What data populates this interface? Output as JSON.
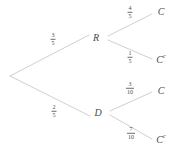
{
  "figure": {
    "type": "probability-tree-diagram",
    "width": 176,
    "height": 152,
    "background_color": "#ffffff",
    "line_color": "#c9c9c9",
    "text_color": "#4a4a4a"
  },
  "nodes": {
    "root": {
      "label": "",
      "x": 10,
      "y": 76
    },
    "r": {
      "label": "R",
      "x": 96,
      "y": 38
    },
    "d": {
      "label": "D",
      "x": 98,
      "y": 113
    },
    "r_c": {
      "label": "C",
      "superscript": "",
      "x": 161,
      "y": 12
    },
    "r_cc": {
      "label": "C",
      "superscript": "c",
      "x": 161,
      "y": 59
    },
    "d_c": {
      "label": "C",
      "superscript": "",
      "x": 161,
      "y": 91
    },
    "d_cc": {
      "label": "C",
      "superscript": "c",
      "x": 161,
      "y": 139
    }
  },
  "edges": [
    {
      "name": "root-to-r",
      "from": "root",
      "to": "r",
      "x1": 10,
      "y1": 76,
      "x2": 89,
      "y2": 35,
      "probability": {
        "numerator": "3",
        "denominator": "5"
      },
      "label_x": 53,
      "label_y": 40
    },
    {
      "name": "root-to-d",
      "from": "root",
      "to": "d",
      "x1": 10,
      "y1": 76,
      "x2": 90,
      "y2": 116,
      "probability": {
        "numerator": "2",
        "denominator": "5"
      },
      "label_x": 54,
      "label_y": 112
    },
    {
      "name": "r-to-c",
      "from": "r",
      "to": "r_c",
      "x1": 108,
      "y1": 36,
      "x2": 152,
      "y2": 14,
      "probability": {
        "numerator": "4",
        "denominator": "5"
      },
      "label_x": 130,
      "label_y": 13
    },
    {
      "name": "r-to-c-complement",
      "from": "r",
      "to": "r_cc",
      "x1": 108,
      "y1": 40,
      "x2": 152,
      "y2": 59,
      "probability": {
        "numerator": "1",
        "denominator": "5"
      },
      "label_x": 130,
      "label_y": 58
    },
    {
      "name": "d-to-c",
      "from": "d",
      "to": "d_c",
      "x1": 110,
      "y1": 111,
      "x2": 152,
      "y2": 92,
      "probability": {
        "numerator": "3",
        "denominator": "10"
      },
      "label_x": 130,
      "label_y": 89
    },
    {
      "name": "d-to-c-complement",
      "from": "d",
      "to": "d_cc",
      "x1": 110,
      "y1": 115,
      "x2": 152,
      "y2": 139,
      "probability": {
        "numerator": "7",
        "denominator": "10"
      },
      "label_x": 131,
      "label_y": 134
    }
  ]
}
